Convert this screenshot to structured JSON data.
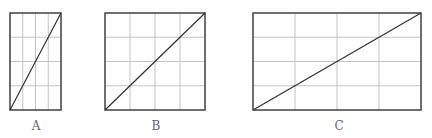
{
  "colors": {
    "border": "#404040",
    "grid": "#c4c4c4",
    "diagonal": "#303030",
    "label": "#666666"
  },
  "figures": [
    {
      "label": "A",
      "x": 10,
      "y": 13,
      "width": 51,
      "height": 97,
      "cols": 4,
      "rows": 4,
      "diagonal": "bottom-left-to-top-right"
    },
    {
      "label": "B",
      "x": 105,
      "y": 13,
      "width": 100,
      "height": 97,
      "cols": 4,
      "rows": 4,
      "diagonal": "bottom-left-to-top-right"
    },
    {
      "label": "C",
      "x": 253,
      "y": 13,
      "width": 168,
      "height": 97,
      "cols": 4,
      "rows": 4,
      "diagonal": "bottom-left-to-top-right"
    }
  ]
}
